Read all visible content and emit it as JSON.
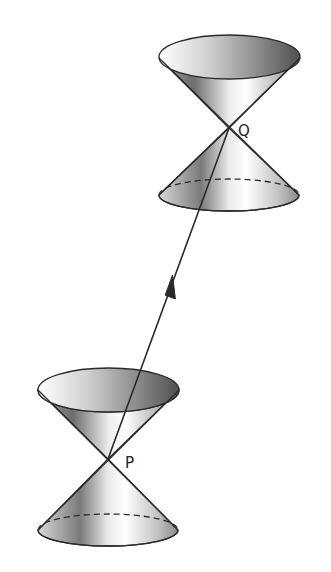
{
  "diagram": {
    "type": "light-cone-worldline",
    "labels": {
      "event_p": "P",
      "event_q": "Q"
    },
    "cones": [
      {
        "id": "cone-q",
        "vertex_label": "Q",
        "vertex": [
          229,
          128
        ]
      },
      {
        "id": "cone-p",
        "vertex_label": "P",
        "vertex": [
          108,
          459
        ]
      }
    ],
    "worldline": {
      "from": "P",
      "to": "Q",
      "arrow_direction": "toward-Q"
    },
    "colors": {
      "background": "#ffffff",
      "stroke": "#2a2a2a",
      "shade_dark": "#5a5a5a",
      "shade_light": "#f2f2f2"
    }
  }
}
